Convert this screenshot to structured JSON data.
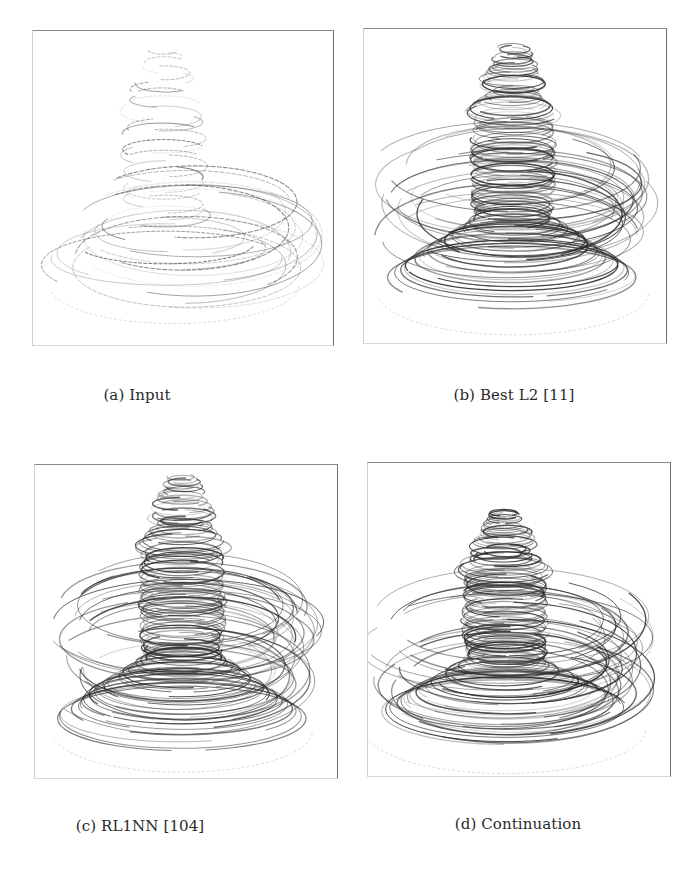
{
  "figure": {
    "panels": [
      {
        "id": "a",
        "caption": "(a) Input",
        "density": "sparse",
        "stroke_color": "#3a3a3a"
      },
      {
        "id": "b",
        "caption": "(b) Best L2 [11]",
        "density": "dense",
        "stroke_color": "#2e2e2e"
      },
      {
        "id": "c",
        "caption": "(c) RL1NN [104]",
        "density": "dense",
        "stroke_color": "#2b2b2b"
      },
      {
        "id": "d",
        "caption": "(d) Continuation",
        "density": "dense",
        "stroke_color": "#2b2b2b"
      }
    ]
  }
}
